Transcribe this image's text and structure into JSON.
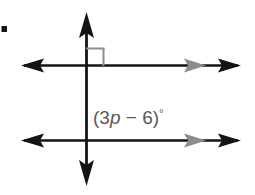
{
  "figure": {
    "background_color": "#ffffff",
    "bullet": {
      "name": "problem-bullet",
      "color": "#141414"
    },
    "angle_label": {
      "full_text": "(3p − 6)°",
      "prefix": "(3",
      "variable": "p",
      "operator": " − ",
      "constant": "6)",
      "degree_symbol": "°",
      "color": "#58595b"
    },
    "lines": [
      {
        "name": "upper-parallel-line",
        "orientation": "horizontal",
        "color": "#141414",
        "left_arrow": "black",
        "right_arrow": "black",
        "parallel_mark": "gray-arrowhead",
        "parallel_mark_color": "#8c8c8c"
      },
      {
        "name": "lower-parallel-line",
        "orientation": "horizontal",
        "color": "#141414",
        "left_arrow": "black",
        "right_arrow": "black",
        "parallel_mark": "gray-arrowhead",
        "parallel_mark_color": "#8c8c8c"
      },
      {
        "name": "transversal-line",
        "orientation": "vertical",
        "color": "#141414",
        "top_arrow": "black",
        "bottom_arrow": "black"
      }
    ],
    "right_angle_marker": {
      "name": "right-angle-square",
      "color": "#8c8c8c",
      "position": "upper-right-of-top-intersection"
    }
  }
}
